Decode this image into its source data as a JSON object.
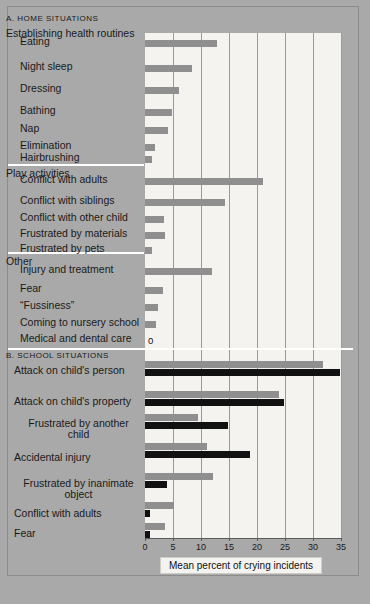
{
  "figure": {
    "axis_title": "Mean percent of crying incidents",
    "zero_marker": "0"
  },
  "sections": {
    "a_header": "A. HOME SITUATIONS",
    "group_health": "Establishing health routines",
    "group_play": "Play activities",
    "group_other": "Other",
    "b_header": "B. SCHOOL SITUATIONS"
  },
  "chart_data": {
    "type": "bar",
    "orientation": "horizontal",
    "xlabel": "Mean percent of crying incidents",
    "ylabel": "",
    "xlim": [
      0,
      35
    ],
    "xticks": [
      0,
      5,
      10,
      15,
      20,
      25,
      30,
      35
    ],
    "xticklabels": [
      "0",
      "5",
      "10",
      "15",
      "20",
      "25",
      "30",
      "35"
    ],
    "grid": true,
    "legend": "none",
    "panels": [
      {
        "name": "A. HOME SITUATIONS",
        "groups": [
          {
            "name": "Establishing health routines",
            "categories": [
              "Eating",
              "Night sleep",
              "Dressing",
              "Bathing",
              "Nap",
              "Elimination",
              "Hairbrushing"
            ],
            "values": [
              12.9,
              8.4,
              6.1,
              4.8,
              4.1,
              1.8,
              1.3
            ]
          },
          {
            "name": "Play activities",
            "categories": [
              "Conflict with adults",
              "Conflict with siblings",
              "Conflict with other child",
              "Frustrated by materials",
              "Frustrated by pets"
            ],
            "values": [
              21.0,
              14.3,
              3.4,
              3.5,
              1.3
            ]
          },
          {
            "name": "Other",
            "categories": [
              "Injury and treatment",
              "Fear",
              "“Fussiness”",
              "Coming to nursery school",
              "Medical and dental care"
            ],
            "values": [
              12.0,
              3.3,
              2.4,
              2.0,
              0.0
            ]
          }
        ]
      },
      {
        "name": "B. SCHOOL SITUATIONS",
        "series": [
          {
            "name": "light-gray-series",
            "color": "#8f8f8f"
          },
          {
            "name": "black-series",
            "color": "#111111"
          }
        ],
        "categories": [
          "Attack on child's person",
          "Attack on child's property",
          "Frustrated by another\nchild",
          "Accidental injury",
          "Frustrated by inanimate\nobject",
          "Conflict with adults",
          "Fear"
        ],
        "values_gray": [
          31.8,
          24.0,
          9.5,
          11.0,
          12.1,
          5.2,
          3.6
        ],
        "values_black": [
          34.8,
          24.8,
          14.8,
          18.8,
          3.9,
          0.9,
          0.9
        ]
      }
    ]
  },
  "rows_home": [
    {
      "label": "Eating",
      "value": 12.9
    },
    {
      "label": "Night sleep",
      "value": 8.4
    },
    {
      "label": "Dressing",
      "value": 6.1
    },
    {
      "label": "Bathing",
      "value": 4.8
    },
    {
      "label": "Nap",
      "value": 4.1
    },
    {
      "label": "Elimination",
      "value": 1.8
    },
    {
      "label": "Hairbrushing",
      "value": 1.3
    },
    {
      "label": "Conflict with adults",
      "value": 21.0
    },
    {
      "label": "Conflict with siblings",
      "value": 14.3
    },
    {
      "label": "Conflict with other child",
      "value": 3.4
    },
    {
      "label": "Frustrated by materials",
      "value": 3.5
    },
    {
      "label": "Frustrated by pets",
      "value": 1.3
    },
    {
      "label": "Injury and treatment",
      "value": 12.0
    },
    {
      "label": "Fear",
      "value": 3.3
    },
    {
      "label": "“Fussiness”",
      "value": 2.4
    },
    {
      "label": "Coming to nursery school",
      "value": 2.0
    },
    {
      "label": "Medical and dental care",
      "value": 0.0
    }
  ],
  "rows_school": [
    {
      "label": "Attack on child's person",
      "gray": 31.8,
      "black": 34.8
    },
    {
      "label": "Attack on child's property",
      "gray": 24.0,
      "black": 24.8
    },
    {
      "label": "Frustrated by another\nchild",
      "gray": 9.5,
      "black": 14.8
    },
    {
      "label": "Accidental injury",
      "gray": 11.0,
      "black": 18.8
    },
    {
      "label": "Frustrated by inanimate\nobject",
      "gray": 12.1,
      "black": 3.9
    },
    {
      "label": "Conflict with adults",
      "gray": 5.2,
      "black": 0.9
    },
    {
      "label": "Fear",
      "gray": 3.6,
      "black": 0.9
    }
  ]
}
